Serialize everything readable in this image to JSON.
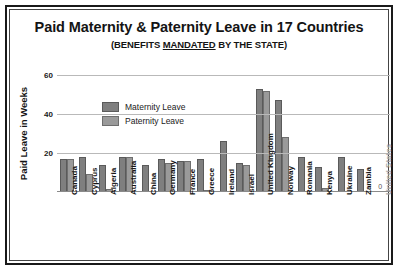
{
  "chart_data": {
    "type": "bar",
    "title": "Paid Maternity & Paternity Leave in 17 Countries",
    "subtitle_prefix": "(BENEFITS ",
    "subtitle_underlined": "MANDATED",
    "subtitle_suffix": " BY THE STATE)",
    "xlabel": "",
    "ylabel": "Paid Leave in Weeks",
    "ylim": [
      0,
      60
    ],
    "yticks": [
      20,
      40,
      60
    ],
    "grid": true,
    "legend_position": "inside-upper-left",
    "categories": [
      "Canada",
      "Cyprus",
      "Algeria",
      "Australia",
      "China",
      "Germany",
      "France",
      "Greece",
      "Ireland",
      "Israel",
      "United Kingdom",
      "Norway",
      "Romania",
      "Kenya",
      "Ukraine",
      "Zambia",
      "United States"
    ],
    "muted_categories": [
      "United States"
    ],
    "series": [
      {
        "name": "Maternity Leave",
        "color": "#7f7f7f",
        "values": [
          17,
          18,
          14,
          18,
          14,
          17,
          16,
          17,
          26,
          15,
          53,
          47,
          18,
          13,
          18,
          12,
          0
        ]
      },
      {
        "name": "Paternity Leave",
        "color": "#9a9a9a",
        "values": [
          17,
          9,
          1.5,
          18,
          0,
          15,
          16,
          0.5,
          0,
          14,
          52,
          28,
          0,
          2,
          0,
          0,
          0
        ]
      }
    ],
    "annotations": [
      {
        "category": "United States",
        "text": "0"
      }
    ]
  }
}
